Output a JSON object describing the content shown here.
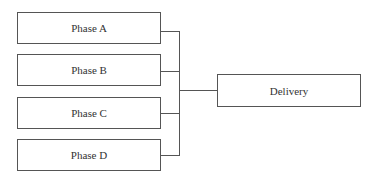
{
  "diagram": {
    "type": "tree-merge",
    "inputs": [
      {
        "label": "Phase A"
      },
      {
        "label": "Phase B"
      },
      {
        "label": "Phase C"
      },
      {
        "label": "Phase D"
      }
    ],
    "output": {
      "label": "Delivery"
    },
    "colors": {
      "stroke": "#555555",
      "text": "#333333",
      "background": "#ffffff"
    }
  }
}
